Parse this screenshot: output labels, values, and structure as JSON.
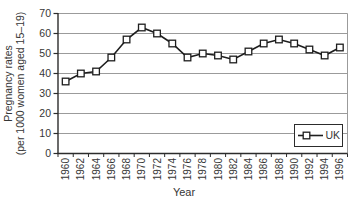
{
  "figure": {
    "background": "#ffffff"
  },
  "chart_data": {
    "type": "line",
    "title": "",
    "xlabel": "Year",
    "ylabel_lines": [
      "Pregnancy rates",
      "(per 1000 women aged 15–19)"
    ],
    "categories": [
      "1960",
      "1962",
      "1964",
      "1966",
      "1968",
      "1970",
      "1972",
      "1974",
      "1976",
      "1978",
      "1980",
      "1982",
      "1984",
      "1986",
      "1988",
      "1990",
      "1992",
      "1994",
      "1996"
    ],
    "series": [
      {
        "name": "UK",
        "marker": "open-square",
        "values": [
          36,
          40,
          41,
          48,
          57,
          63,
          60,
          55,
          48,
          50,
          49,
          47,
          51,
          55,
          57,
          55,
          52,
          49,
          53
        ]
      }
    ],
    "ylim": [
      0,
      70
    ],
    "yticks": [
      0,
      10,
      20,
      30,
      40,
      50,
      60,
      70
    ],
    "grid": true,
    "legend_position": "bottom-right",
    "colors": {
      "line": "#1e1e1e",
      "grid": "#9b9b9b",
      "axis": "#2c2c2c",
      "text": "#363636",
      "marker_fill": "#ffffff",
      "legend_bg": "#ffffff"
    }
  }
}
